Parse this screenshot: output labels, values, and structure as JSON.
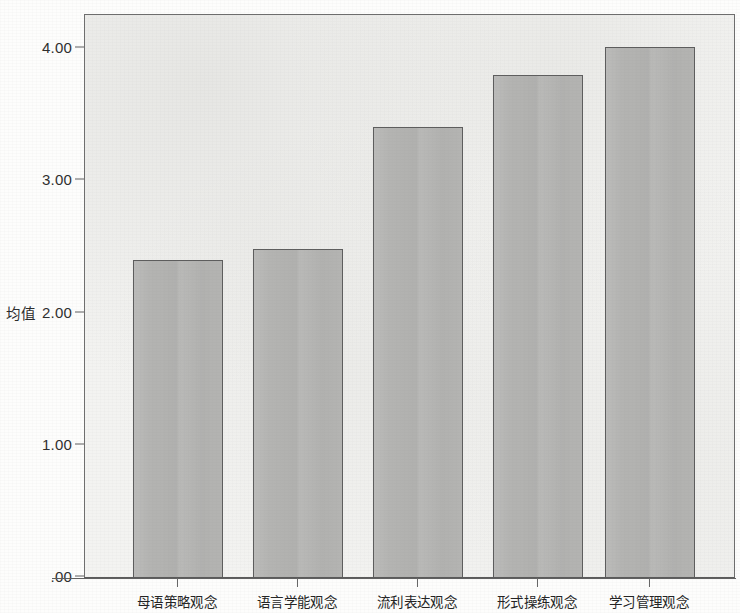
{
  "chart_data": {
    "type": "bar",
    "title": "",
    "subtitle": "",
    "xlabel": "",
    "ylabel": "均值",
    "categories": [
      "母语策略观念",
      "语言学能观念",
      "流利表达观念",
      "形式操练观念",
      "学习管理观念"
    ],
    "values": [
      2.4,
      2.48,
      3.4,
      3.8,
      4.01
    ],
    "ylim": [
      0.0,
      4.25
    ],
    "y_ticks": [
      {
        "value": 4.0,
        "label": "4.00"
      },
      {
        "value": 3.0,
        "label": "3.00"
      },
      {
        "value": 2.0,
        "label": "2.00"
      },
      {
        "value": 1.0,
        "label": "1.00"
      },
      {
        "value": 0.0,
        "label": ".00"
      }
    ],
    "grid": false,
    "legend": null,
    "legend_position": "none",
    "series": [
      {
        "name": "均值",
        "values": [
          2.4,
          2.48,
          3.4,
          3.8,
          4.01
        ]
      }
    ]
  },
  "style": {
    "bar_fill": "#b4b4b2",
    "bar_border": "#5d5d5d",
    "plot_background": "#f3f3f1",
    "plot_border": "#6d6d6d",
    "page_background": "#fdfdfc",
    "axis_color": "#5f5f5f",
    "text_color": "#232323"
  }
}
